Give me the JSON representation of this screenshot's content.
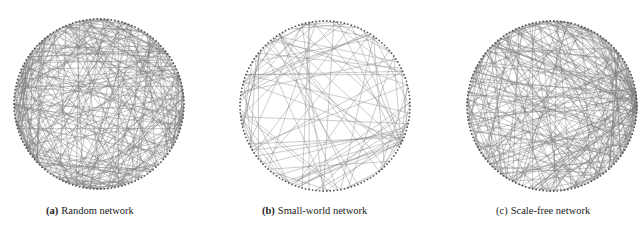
{
  "figure": {
    "background": "#ffffff",
    "edge_color": "#7a7a7a",
    "node_color": "#555555",
    "panels": [
      {
        "id": "a",
        "tag": "(a)",
        "tag_bold": true,
        "caption": "Random network",
        "graph_type": "random",
        "layout": "circular",
        "center": [
          99,
          104
        ],
        "radius": 85,
        "node_count": 150,
        "edge_count": 300,
        "seed": 11,
        "caption_x": 46
      },
      {
        "id": "b",
        "tag": "(b)",
        "tag_bold": true,
        "caption": "Small-world network",
        "graph_type": "small-world",
        "layout": "circular",
        "center": [
          325,
          106
        ],
        "radius": 85,
        "node_count": 150,
        "edge_count": 110,
        "seed": 23,
        "caption_x": 262
      },
      {
        "id": "c",
        "tag": "(c)",
        "tag_bold": false,
        "caption": "Scale-free network",
        "graph_type": "scale-free",
        "layout": "circular",
        "center": [
          552,
          106
        ],
        "radius": 85,
        "node_count": 150,
        "edge_count": 290,
        "hub_angle_deg": -3,
        "seed": 37,
        "caption_x": 496
      }
    ]
  }
}
